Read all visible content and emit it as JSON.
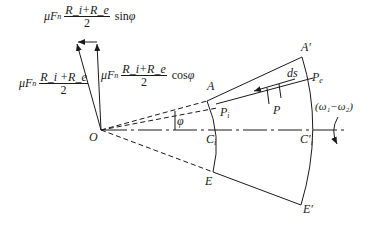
{
  "formulas": {
    "sin_component": {
      "prefix": "μF",
      "prefix_sub": "n",
      "numerator": "R_i+R_e",
      "denominator": "2",
      "trig": "sin",
      "angle": "φ"
    },
    "total": {
      "prefix": "μF",
      "prefix_sub": "n",
      "numerator": "R_i +R_e",
      "denominator": "2"
    },
    "cos_component": {
      "prefix": "μF",
      "prefix_sub": "n",
      "numerator": "R_i+R_e",
      "denominator": "2",
      "trig": "cos",
      "angle": "φ"
    }
  },
  "points": {
    "O": "O",
    "A": "A",
    "A_prime": "A′",
    "P_i": "P",
    "P_i_sub": "i",
    "P_e": "P",
    "P_e_sub": "e",
    "P": "P",
    "ds": "ds",
    "C_i": "C",
    "C_i_sub": "i",
    "C_i_prime": "C′",
    "C_i_prime_sub": "i",
    "E": "E",
    "E_prime": "E′",
    "phi": "φ",
    "omega": "(ω₁−ω₂)"
  },
  "colors": {
    "line": "#1a1a1a",
    "background": "#ffffff"
  }
}
